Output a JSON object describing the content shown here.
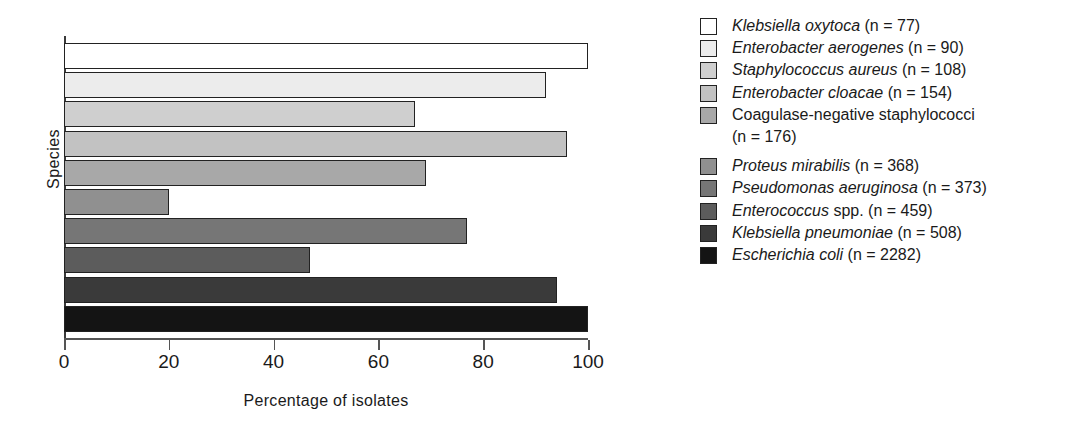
{
  "chart_data": {
    "type": "bar",
    "orientation": "horizontal",
    "title": "",
    "xlabel": "Percentage of isolates",
    "ylabel": "Species",
    "xlim": [
      0,
      100
    ],
    "xticks": [
      0,
      20,
      40,
      60,
      80,
      100
    ],
    "grid": false,
    "legend_position": "right",
    "categories": [
      "Klebsiella oxytoca",
      "Enterobacter aerogenes",
      "Staphylococcus aureus",
      "Enterobacter cloacae",
      "Coagulase-negative staphylococci",
      "Proteus mirabilis",
      "Pseudomonas aeruginosa",
      "Enterococcus spp.",
      "Klebsiella pneumoniae",
      "Escherichia coli"
    ],
    "values": [
      100,
      92,
      67,
      96,
      69,
      20,
      77,
      47,
      94,
      100
    ],
    "colors": [
      "#ffffff",
      "#ececec",
      "#cfcfcf",
      "#c2c2c2",
      "#a8a8a8",
      "#909090",
      "#767676",
      "#5c5c5c",
      "#3a3a3a",
      "#141414"
    ]
  },
  "axes": {
    "y_axis_title": "Species",
    "x_axis_title": "Percentage of isolates",
    "x_tick_labels": [
      "0",
      "20",
      "40",
      "60",
      "80",
      "100"
    ]
  },
  "legend": {
    "items": [
      {
        "species": "Klebsiella oxytoca",
        "species_italic": "Klebsiella oxytoca",
        "species_roman": "",
        "count_label": "(n = 77)",
        "color": "#ffffff",
        "wrap_line": ""
      },
      {
        "species": "Enterobacter aerogenes",
        "species_italic": "Enterobacter aerogenes",
        "species_roman": "",
        "count_label": "(n = 90)",
        "color": "#ececec",
        "wrap_line": ""
      },
      {
        "species": "Staphylococcus aureus",
        "species_italic": "Staphylococcus aureus",
        "species_roman": "",
        "count_label": "(n = 108)",
        "color": "#cfcfcf",
        "wrap_line": ""
      },
      {
        "species": "Enterobacter cloacae",
        "species_italic": "Enterobacter cloacae",
        "species_roman": "",
        "count_label": "(n = 154)",
        "color": "#c2c2c2",
        "wrap_line": ""
      },
      {
        "species": "Coagulase-negative staphylococci",
        "species_italic": "",
        "species_roman": "Coagulase-negative staphylococci",
        "count_label": "",
        "color": "#a8a8a8",
        "wrap_line": "(n = 176)"
      },
      {
        "species": "Proteus mirabilis",
        "species_italic": "Proteus mirabilis",
        "species_roman": "",
        "count_label": "(n = 368)",
        "color": "#909090",
        "wrap_line": ""
      },
      {
        "species": "Pseudomonas aeruginosa",
        "species_italic": "Pseudomonas aeruginosa",
        "species_roman": "",
        "count_label": "(n = 373)",
        "color": "#767676",
        "wrap_line": ""
      },
      {
        "species": "Enterococcus spp.",
        "species_italic": "Enterococcus",
        "species_roman": "spp.",
        "count_label": "(n = 459)",
        "color": "#5c5c5c",
        "wrap_line": ""
      },
      {
        "species": "Klebsiella pneumoniae",
        "species_italic": "Klebsiella pneumoniae",
        "species_roman": "",
        "count_label": "(n = 508)",
        "color": "#3a3a3a",
        "wrap_line": ""
      },
      {
        "species": "Escherichia coli",
        "species_italic": "Escherichia coli",
        "species_roman": "",
        "count_label": "(n = 2282)",
        "color": "#141414",
        "wrap_line": ""
      }
    ]
  }
}
